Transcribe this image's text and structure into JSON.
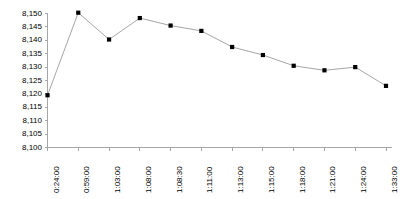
{
  "chart_data": {
    "type": "line",
    "title": "",
    "subtitle": "",
    "xlabel": "",
    "ylabel": "",
    "categories": [
      "0:24:00",
      "0:59:00",
      "1:03:00",
      "1:08:00",
      "1:08:30",
      "1:11:00",
      "1:13:00",
      "1:15:00",
      "1:18:00",
      "1:21:00",
      "1:24:00",
      "1:33:00"
    ],
    "values": [
      8119.5,
      8150.3,
      8140.3,
      8148.3,
      8145.5,
      8143.5,
      8137.5,
      8134.5,
      8130.5,
      8128.8,
      8130.0,
      8123.0
    ],
    "ylim": [
      8100,
      8150
    ],
    "ytick_step": 5,
    "ytick_labels": [
      "8,150",
      "8,145",
      "8,140",
      "8,135",
      "8,130",
      "8,125",
      "8,120",
      "8,115",
      "8,110",
      "8,105",
      "8,100"
    ],
    "ytick_values": [
      8150,
      8145,
      8140,
      8135,
      8130,
      8125,
      8120,
      8115,
      8110,
      8105,
      8100
    ],
    "grid": false,
    "legend": "none",
    "marker": "square",
    "marker_color": "#000000",
    "line_color": "#a6a6a6",
    "axis_color": "#a6a6a6",
    "text_color": "#000000",
    "background": "#ffffff"
  }
}
